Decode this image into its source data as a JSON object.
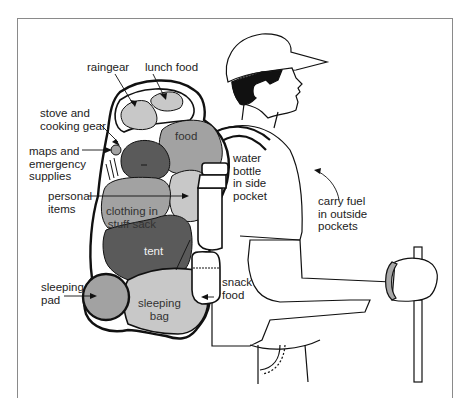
{
  "diagram": {
    "colors": {
      "light_gray": "#c8c8c8",
      "mid_gray": "#a2a2a2",
      "dark_gray": "#5a5a5a",
      "outline": "#111111",
      "frame": "#8a8a8a"
    },
    "labels": {
      "raingear": "raingear",
      "lunch_food": "lunch food",
      "stove": "stove and\ncooking gear",
      "maps": "maps and\nemergency\nsupplies",
      "personal": "personal\nitems",
      "food": "food",
      "clothing": "clothing in\nstuff sack",
      "tent": "tent",
      "sleeping_pad": "sleeping\npad",
      "sleeping_bag": "sleeping\nbag",
      "water_bottle": "water\nbottle\nin side\npocket",
      "snack_food": "snack\nfood",
      "carry_fuel": "carry fuel\nin outside\npockets"
    }
  }
}
